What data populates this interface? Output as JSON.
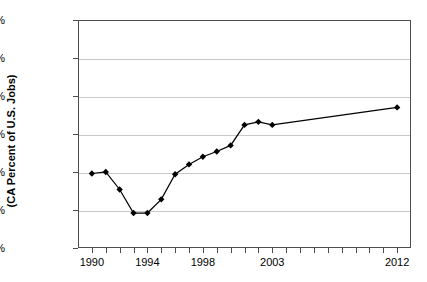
{
  "chart_data": {
    "type": "line",
    "title": "",
    "xlabel": "",
    "ylabel": "(CA Percent of U.S. Jobs)",
    "ylim": [
      7.0,
      10.0
    ],
    "xlim": [
      1989,
      2013
    ],
    "grid": true,
    "legend": "none",
    "y_tick_labels": [
      "10.0%",
      "9.5%",
      "9.0%",
      "8.5%",
      "8.0%",
      "7.5%",
      "7.0%"
    ],
    "y_tick_values": [
      10.0,
      9.5,
      9.0,
      8.5,
      8.0,
      7.5,
      7.0
    ],
    "x_tick_values": [
      1990,
      1991,
      1992,
      1993,
      1994,
      1995,
      1996,
      1997,
      1998,
      1999,
      2000,
      2001,
      2002,
      2003,
      2004,
      2005,
      2006,
      2007,
      2008,
      2009,
      2010,
      2011,
      2012
    ],
    "x_tick_labels_shown": [
      {
        "value": 1990,
        "label": "1990"
      },
      {
        "value": 1994,
        "label": "1994"
      },
      {
        "value": 1998,
        "label": "1998"
      },
      {
        "value": 2003,
        "label": "2003"
      },
      {
        "value": 2012,
        "label": "2012"
      }
    ],
    "x": [
      1990,
      1991,
      1992,
      1993,
      1994,
      1995,
      1996,
      1997,
      1998,
      1999,
      2000,
      2001,
      2002,
      2003,
      2012
    ],
    "values": [
      7.98,
      8.0,
      7.77,
      7.46,
      7.46,
      7.64,
      7.97,
      8.1,
      8.2,
      8.27,
      8.35,
      8.62,
      8.66,
      8.62,
      8.85
    ],
    "series": [
      {
        "name": "CA Percent of U.S. Jobs",
        "marker": "diamond",
        "color": "#000000",
        "points": [
          {
            "x": 1990,
            "y": 7.98
          },
          {
            "x": 1991,
            "y": 8.0
          },
          {
            "x": 1992,
            "y": 7.77
          },
          {
            "x": 1993,
            "y": 7.46
          },
          {
            "x": 1994,
            "y": 7.46
          },
          {
            "x": 1995,
            "y": 7.64
          },
          {
            "x": 1996,
            "y": 7.97
          },
          {
            "x": 1997,
            "y": 8.1
          },
          {
            "x": 1998,
            "y": 8.2
          },
          {
            "x": 1999,
            "y": 8.27
          },
          {
            "x": 2000,
            "y": 8.35
          },
          {
            "x": 2001,
            "y": 8.62
          },
          {
            "x": 2002,
            "y": 8.66
          },
          {
            "x": 2003,
            "y": 8.62
          },
          {
            "x": 2012,
            "y": 8.85
          }
        ]
      }
    ],
    "colors": {
      "line": "#000000",
      "marker": "#000000",
      "grid": "#c9c9c9",
      "axis": "#4d4d4d",
      "background": "#ffffff",
      "text": "#000000"
    }
  }
}
